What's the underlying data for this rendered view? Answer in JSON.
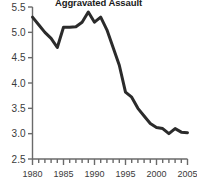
{
  "chart_data": {
    "type": "line",
    "title": "Aggravated Assault",
    "subtitle": "",
    "xlabel": "",
    "ylabel": "",
    "xlim": [
      1980,
      2005
    ],
    "ylim": [
      2.5,
      5.5
    ],
    "grid": false,
    "legend": "none",
    "x_tick_labels": [
      "1980",
      "1985",
      "1990",
      "1995",
      "2000",
      "2005"
    ],
    "x_tick_values": [
      1980,
      1985,
      1990,
      1995,
      2000,
      2005
    ],
    "x_minor_tick_interval": 1,
    "y_tick_labels": [
      "5.5",
      "5.0",
      "4.5",
      "4.0",
      "3.5",
      "3.0",
      "2.5"
    ],
    "y_tick_values": [
      5.5,
      5.0,
      4.5,
      4.0,
      3.5,
      3.0,
      2.5
    ],
    "line_color": "#2b2b2b",
    "line_width": 3,
    "axis_color": "#6a6a6a",
    "x": [
      1980,
      1981,
      1982,
      1983,
      1984,
      1985,
      1986,
      1987,
      1988,
      1989,
      1990,
      1991,
      1992,
      1993,
      1994,
      1995,
      1996,
      1997,
      1998,
      1999,
      2000,
      2001,
      2002,
      2003,
      2004,
      2005
    ],
    "values": [
      5.3,
      5.15,
      5.0,
      4.88,
      4.7,
      5.1,
      5.1,
      5.11,
      5.2,
      5.4,
      5.2,
      5.3,
      5.05,
      4.7,
      4.35,
      3.82,
      3.72,
      3.5,
      3.35,
      3.2,
      3.12,
      3.1,
      3.0,
      3.1,
      3.03,
      3.02
    ],
    "series": [
      {
        "name": "Aggravated Assault",
        "values": [
          5.3,
          5.15,
          5.0,
          4.88,
          4.7,
          5.1,
          5.1,
          5.11,
          5.2,
          5.4,
          5.2,
          5.3,
          5.05,
          4.7,
          4.35,
          3.82,
          3.72,
          3.5,
          3.35,
          3.2,
          3.12,
          3.1,
          3.0,
          3.1,
          3.03,
          3.02
        ]
      }
    ]
  }
}
